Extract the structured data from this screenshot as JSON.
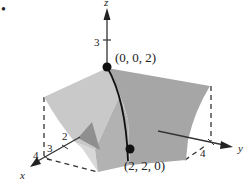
{
  "figure": {
    "bullet": "•",
    "axes": {
      "z": {
        "label": "z",
        "ticks": [
          "3"
        ]
      },
      "x": {
        "label": "x",
        "ticks": [
          "2",
          "3",
          "4"
        ]
      },
      "y": {
        "label": "y",
        "ticks": [
          "4"
        ]
      }
    },
    "points": [
      {
        "label": "(0, 0, 2)"
      },
      {
        "label": "(2, 2, 0)"
      }
    ],
    "colors": {
      "surface_dark": "#9a9a9a",
      "surface_mid": "#b4b4b4",
      "surface_light": "#cdcdcd",
      "axis": "#333333",
      "point": "#111111"
    }
  }
}
